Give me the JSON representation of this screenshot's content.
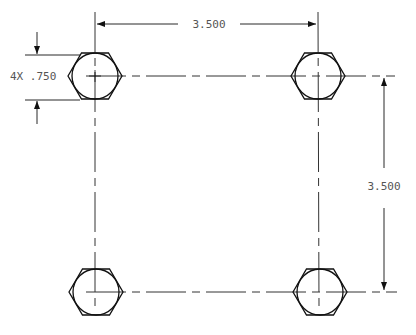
{
  "drawing": {
    "colors": {
      "line": "#111111",
      "thin": "#333333",
      "text": "#555555",
      "background": "#ffffff"
    },
    "holes": [
      {
        "id": "top-left",
        "cx": 95,
        "cy": 76
      },
      {
        "id": "top-right",
        "cx": 318,
        "cy": 76
      },
      {
        "id": "bottom-left",
        "cx": 96,
        "cy": 292
      },
      {
        "id": "bottom-right",
        "cx": 320,
        "cy": 292
      }
    ],
    "hex_radius": 27,
    "circle_radius": 23,
    "dimensions": {
      "horizontal": {
        "label": "3.500"
      },
      "vertical": {
        "label": "3.500"
      },
      "hole_size": {
        "label": "4X .750"
      }
    }
  }
}
